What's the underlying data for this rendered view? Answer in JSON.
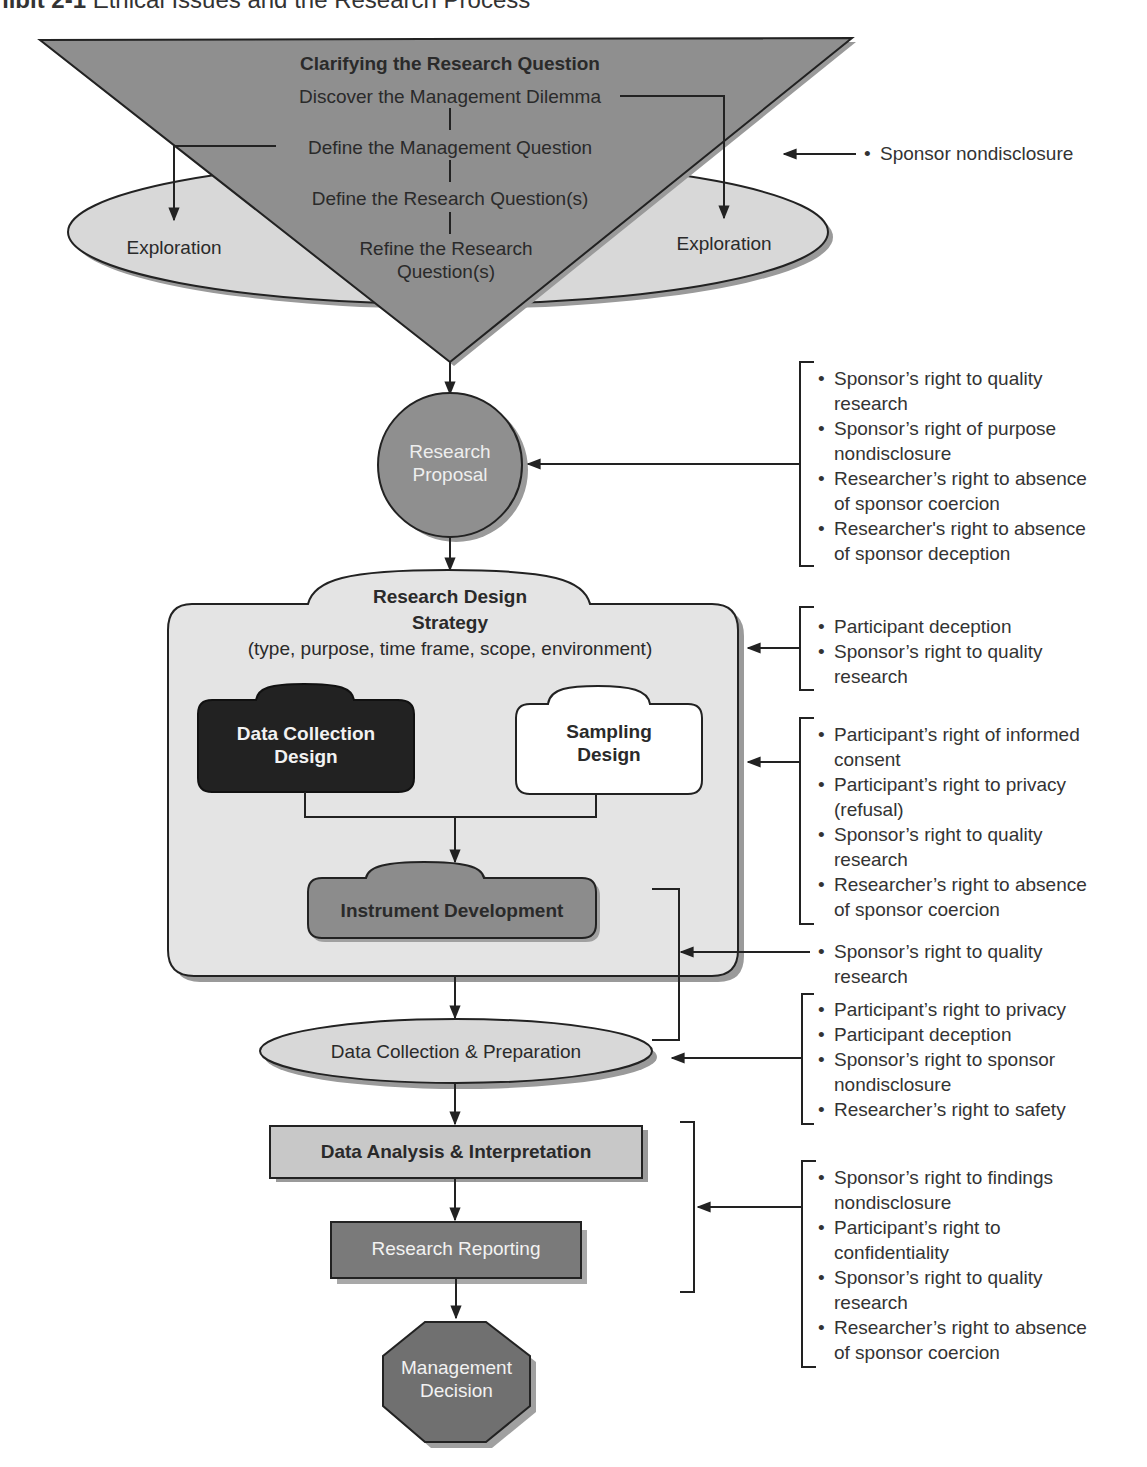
{
  "exhibit": {
    "label": "hibit 2-1",
    "title": "Ethical Issues and the Research Process"
  },
  "colors": {
    "triangle": "#8f8f8f",
    "ellipse": "#d8d8d8",
    "circle": "#8f8f8f",
    "design_box": "#e4e4e4",
    "data_collection_design": "#222222",
    "sampling_design": "#ffffff",
    "instrument": "#8c8c8c",
    "analysis_box": "#c8c8c8",
    "reporting_box": "#7a7a7a",
    "decision_octagon": "#707070",
    "shadow": "#9a9a9a",
    "stroke": "#222222"
  },
  "clarify": {
    "heading": "Clarifying the Research Question",
    "steps": [
      "Discover the Management Dilemma",
      "Define the Management Question",
      "Define the Research Question(s)",
      "Refine the Research",
      "Question(s)"
    ],
    "exploration_left": "Exploration",
    "exploration_right": "Exploration"
  },
  "proposal": {
    "line1": "Research",
    "line2": "Proposal"
  },
  "design": {
    "heading1": "Research Design",
    "heading2": "Strategy",
    "subtitle": "(type, purpose, time frame, scope, environment)",
    "data_collection": {
      "line1": "Data Collection",
      "line2": "Design"
    },
    "sampling": {
      "line1": "Sampling",
      "line2": "Design"
    },
    "instrument": "Instrument Development"
  },
  "collection": "Data Collection & Preparation",
  "analysis": "Data Analysis & Interpretation",
  "reporting": "Research Reporting",
  "decision": {
    "line1": "Management",
    "line2": "Decision"
  },
  "issues": {
    "clarify": [
      "Sponsor nondisclosure"
    ],
    "proposal": [
      "Sponsor’s right to quality research",
      "Sponsor’s right of purpose nondisclosure",
      "Researcher’s right to absence of sponsor coercion",
      "Researcher's right to absence of sponsor deception"
    ],
    "design_strategy": [
      "Participant deception",
      "Sponsor’s right to quality research"
    ],
    "design_sub": [
      "Participant’s right of informed consent",
      "Participant’s right to privacy (refusal)",
      "Sponsor’s right to quality research",
      "Researcher’s right to absence of sponsor coercion"
    ],
    "instrument_collection": [
      "Sponsor’s right to quality research"
    ],
    "collection": [
      "Participant’s right to privacy",
      "Participant deception",
      "Sponsor’s right to sponsor nondisclosure",
      "Researcher’s right to safety"
    ],
    "analysis_reporting": [
      "Sponsor’s right to findings nondisclosure",
      "Participant’s right to confidentiality",
      "Sponsor’s right to quality research",
      "Researcher’s right to absence of sponsor coercion"
    ]
  },
  "issue_lines": {
    "clarify": [
      "Sponsor nondisclosure"
    ],
    "proposal": [
      "Sponsor’s right to quality",
      "research",
      "Sponsor’s right of purpose",
      "nondisclosure",
      "Researcher’s right to absence",
      "of sponsor coercion",
      "Researcher's right to absence",
      "of sponsor deception"
    ],
    "design_strategy": [
      "Participant deception",
      "Sponsor’s right to quality",
      "research"
    ],
    "design_sub": [
      "Participant’s right of informed",
      "consent",
      "Participant’s right to privacy",
      "(refusal)",
      "Sponsor’s right to quality",
      "research",
      "Researcher’s right to absence",
      "of sponsor coercion"
    ],
    "instrument_collection": [
      "Sponsor’s right to quality",
      "research"
    ],
    "collection": [
      "Participant’s right to privacy",
      "Participant deception",
      "Sponsor’s right to sponsor",
      "nondisclosure",
      "Researcher’s right to safety"
    ],
    "analysis_reporting": [
      "Sponsor’s right to findings",
      "nondisclosure",
      "Participant’s right to",
      "confidentiality",
      "Sponsor’s right to quality",
      "research",
      "Researcher’s right to absence",
      "of sponsor coercion"
    ]
  }
}
